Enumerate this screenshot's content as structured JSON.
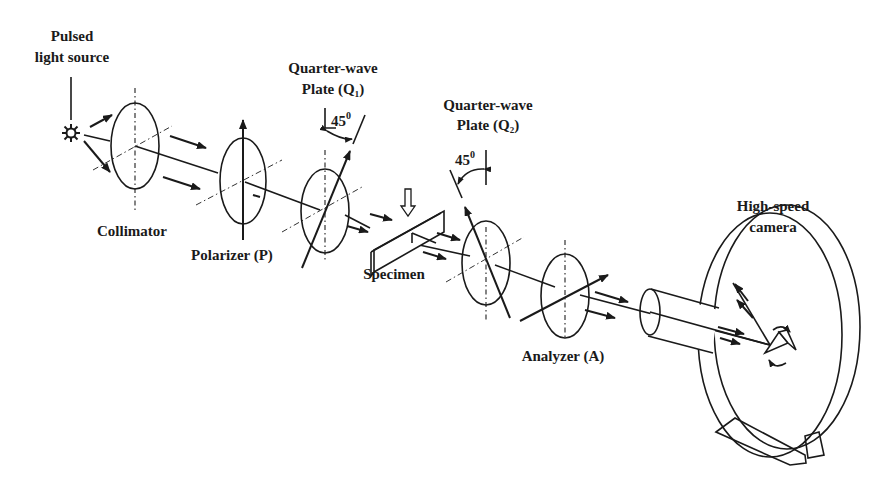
{
  "diagram": {
    "components": [
      {
        "id": "source",
        "label_lines": [
          "Pulsed",
          "light source"
        ]
      },
      {
        "id": "collimator",
        "label_lines": [
          "Collimator"
        ]
      },
      {
        "id": "polarizer",
        "label_lines": [
          "Polarizer (P)"
        ]
      },
      {
        "id": "q1",
        "label_lines": [
          "Quarter-wave",
          "Plate (Q₁)"
        ],
        "angle": "45⁰"
      },
      {
        "id": "specimen",
        "label_lines": [
          "Specimen"
        ]
      },
      {
        "id": "q2",
        "label_lines": [
          "Quarter-wave",
          "Plate (Q₂)"
        ],
        "angle": "45⁰"
      },
      {
        "id": "analyzer",
        "label_lines": [
          "Analyzer (A)"
        ]
      },
      {
        "id": "camera",
        "label_lines": [
          "High-speed",
          "camera"
        ]
      }
    ],
    "connections": [
      {
        "from": "source",
        "to": "collimator"
      },
      {
        "from": "collimator",
        "to": "polarizer"
      },
      {
        "from": "polarizer",
        "to": "q1"
      },
      {
        "from": "q1",
        "to": "specimen"
      },
      {
        "from": "specimen",
        "to": "q2"
      },
      {
        "from": "q2",
        "to": "analyzer"
      },
      {
        "from": "analyzer",
        "to": "camera"
      }
    ]
  },
  "labels": {
    "source_l1": "Pulsed",
    "source_l2": "light source",
    "collimator": "Collimator",
    "polarizer": "Polarizer (P)",
    "q1_l1": "Quarter-wave",
    "q1_l2": "Plate (Q₁)",
    "q1_angle": "45",
    "q1_angle_sup": "0",
    "specimen": "Specimen",
    "q2_l1": "Quarter-wave",
    "q2_l2": "Plate (Q₂)",
    "q2_angle": "45",
    "q2_angle_sup": "0",
    "analyzer": "Analyzer (A)",
    "camera_l1": "High-speed",
    "camera_l2": "camera"
  }
}
